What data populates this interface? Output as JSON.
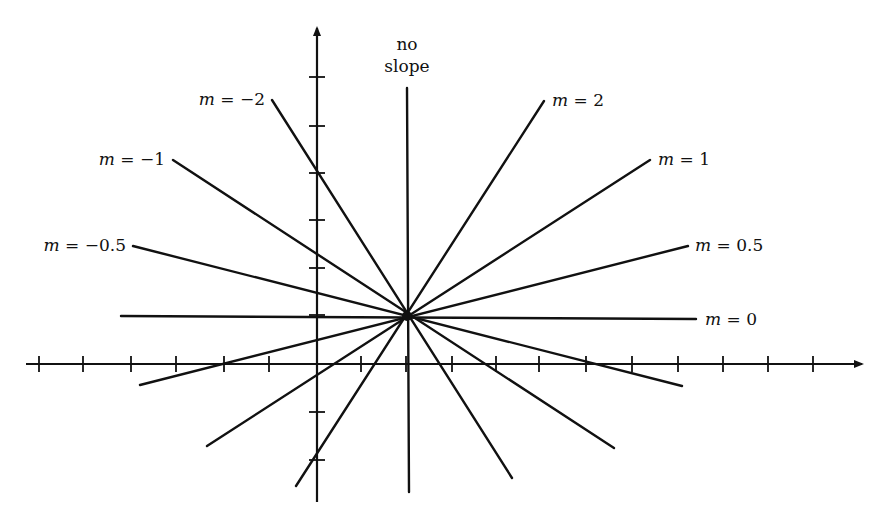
{
  "figure": {
    "type": "slope-diagram",
    "background": "#ffffff",
    "ink": "#111111"
  },
  "axes": {
    "x_axis": {
      "y": 364,
      "x_start": 26,
      "x_end": 862,
      "arrow": true
    },
    "y_axis": {
      "x": 317,
      "y_start": 502,
      "y_end": 28,
      "arrow": true
    },
    "x_ticks": [
      39,
      83,
      131,
      176,
      224,
      269,
      361,
      406,
      452,
      496,
      539,
      586,
      632,
      678,
      723,
      768,
      813
    ],
    "y_ticks": [
      77,
      126,
      173,
      220,
      268,
      315,
      412,
      460
    ]
  },
  "center_point": {
    "x": 407,
    "y": 316
  },
  "lines": [
    {
      "id": "no-slope",
      "label_line1": "no",
      "label_line2": "slope",
      "x1": 407,
      "y1": 88,
      "x2": 409,
      "y2": 492,
      "label_x": 407,
      "label_y": 50
    },
    {
      "id": "m2",
      "var": "m",
      "eq": " = 2",
      "x1": 544,
      "y1": 101,
      "x2": 296,
      "y2": 486,
      "label_x": 552,
      "label_y": 106,
      "anchor": "start"
    },
    {
      "id": "m1",
      "var": "m",
      "eq": " = 1",
      "x1": 650,
      "y1": 160,
      "x2": 207,
      "y2": 446,
      "label_x": 658,
      "label_y": 165,
      "anchor": "start"
    },
    {
      "id": "m0_5",
      "var": "m",
      "eq": " = 0.5",
      "x1": 688,
      "y1": 246,
      "x2": 140,
      "y2": 385,
      "label_x": 695,
      "label_y": 251,
      "anchor": "start"
    },
    {
      "id": "m0",
      "var": "m",
      "eq": " = 0",
      "x1": 121,
      "y1": 316,
      "x2": 696,
      "y2": 319,
      "label_x": 705,
      "label_y": 325,
      "anchor": "start"
    },
    {
      "id": "m-0_5",
      "var": "m",
      "eq": " = −0.5",
      "x1": 133,
      "y1": 246,
      "x2": 682,
      "y2": 386,
      "label_x": 126,
      "label_y": 251,
      "anchor": "end"
    },
    {
      "id": "m-1",
      "var": "m",
      "eq": " = −1",
      "x1": 173,
      "y1": 160,
      "x2": 614,
      "y2": 448,
      "label_x": 165,
      "label_y": 165,
      "anchor": "end"
    },
    {
      "id": "m-2",
      "var": "m",
      "eq": " = −2",
      "x1": 272,
      "y1": 100,
      "x2": 512,
      "y2": 478,
      "label_x": 265,
      "label_y": 105,
      "anchor": "end"
    }
  ],
  "labels": {
    "no_slope_1": "no",
    "no_slope_2": "slope",
    "m2": {
      "var": "m",
      "eq": " = 2"
    },
    "m1": {
      "var": "m",
      "eq": " = 1"
    },
    "m0_5": {
      "var": "m",
      "eq": " = 0.5"
    },
    "m0": {
      "var": "m",
      "eq": " = 0"
    },
    "m_neg0_5": {
      "var": "m",
      "eq": " = −0.5"
    },
    "m_neg1": {
      "var": "m",
      "eq": " = −1"
    },
    "m_neg2": {
      "var": "m",
      "eq": " = −2"
    }
  }
}
